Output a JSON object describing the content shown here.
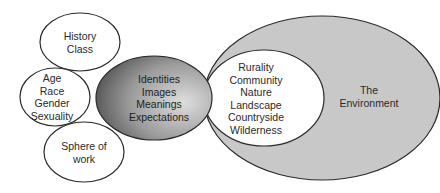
{
  "diagram": {
    "nodes": {
      "history_class": {
        "lines": [
          "History",
          "Class"
        ]
      },
      "age_race": {
        "lines": [
          "Age",
          "Race",
          "Gender",
          "Sexuality"
        ]
      },
      "sphere_work": {
        "lines": [
          "Sphere of",
          "work"
        ]
      },
      "identities": {
        "lines": [
          "Identities",
          "Images",
          "Meanings",
          "Expectations"
        ]
      },
      "rurality": {
        "lines": [
          "Rurality",
          "Community",
          "Nature",
          "Landscape",
          "Countryside",
          "Wilderness"
        ]
      },
      "environment": {
        "lines": [
          "The",
          "Environment"
        ]
      }
    },
    "colors": {
      "environment_fill": "#c8c8c8",
      "identities_dark": "#4a4a4a",
      "identities_light": "#d8d8d8",
      "stroke": "#2a2a2a",
      "white": "#ffffff"
    }
  }
}
